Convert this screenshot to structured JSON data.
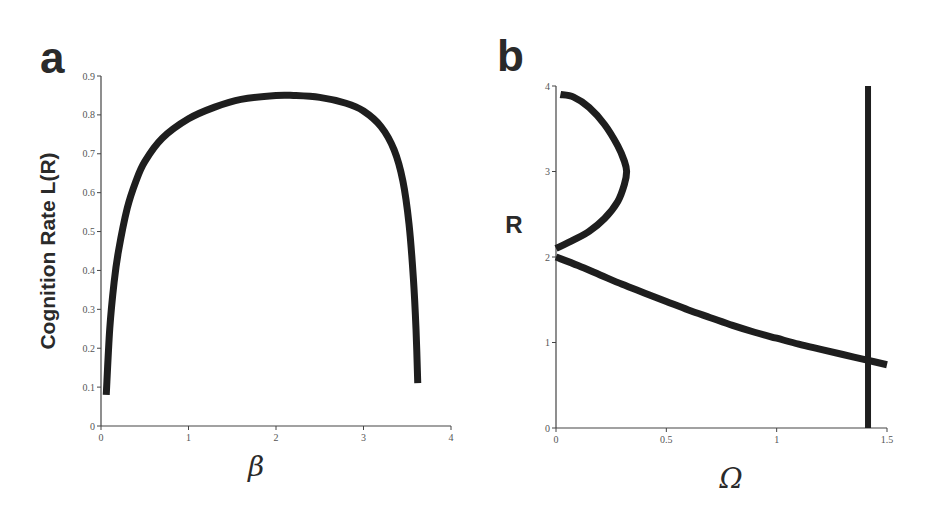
{
  "chart_data": [
    {
      "panel": "a",
      "type": "line",
      "title": "",
      "xlabel": "β",
      "ylabel": "Cognition Rate L(R)",
      "xlim": [
        0,
        4
      ],
      "ylim": [
        0,
        0.9
      ],
      "xticks": [
        "0",
        "1",
        "2",
        "3",
        "4"
      ],
      "yticks": [
        "0",
        "0.1",
        "0.2",
        "0.3",
        "0.4",
        "0.5",
        "0.6",
        "0.7",
        "0.8",
        "0.9"
      ],
      "grid": false,
      "series": [
        {
          "name": "L(R)",
          "x": [
            0.06,
            0.1,
            0.15,
            0.2,
            0.3,
            0.4,
            0.5,
            0.7,
            1.0,
            1.3,
            1.6,
            2.0,
            2.2,
            2.5,
            2.8,
            3.0,
            3.2,
            3.35,
            3.45,
            3.52,
            3.57,
            3.6,
            3.62
          ],
          "y": [
            0.08,
            0.25,
            0.37,
            0.45,
            0.56,
            0.63,
            0.68,
            0.74,
            0.79,
            0.82,
            0.84,
            0.85,
            0.85,
            0.845,
            0.83,
            0.81,
            0.77,
            0.71,
            0.63,
            0.52,
            0.38,
            0.25,
            0.11
          ]
        }
      ],
      "legend": null
    },
    {
      "panel": "b",
      "type": "line",
      "title": "",
      "xlabel": "Ω",
      "ylabel": "R",
      "xlim": [
        0,
        1.5
      ],
      "ylim": [
        0,
        4
      ],
      "xticks": [
        "0",
        "0.5",
        "1",
        "1.5"
      ],
      "yticks": [
        "0",
        "1",
        "2",
        "3",
        "4"
      ],
      "grid": false,
      "series": [
        {
          "name": "upper branch (arc)",
          "x": [
            0.02,
            0.08,
            0.15,
            0.22,
            0.28,
            0.31,
            0.32,
            0.31,
            0.28,
            0.22,
            0.15,
            0.08,
            0.0
          ],
          "y": [
            3.9,
            3.87,
            3.75,
            3.55,
            3.3,
            3.12,
            3.0,
            2.85,
            2.65,
            2.45,
            2.3,
            2.2,
            2.1
          ]
        },
        {
          "name": "lower branch",
          "x": [
            0.0,
            0.1,
            0.2,
            0.3,
            0.4,
            0.5,
            0.6,
            0.7,
            0.8,
            0.9,
            1.0,
            1.1,
            1.2,
            1.3,
            1.4,
            1.5
          ],
          "y": [
            2.0,
            1.9,
            1.79,
            1.68,
            1.58,
            1.48,
            1.38,
            1.29,
            1.2,
            1.12,
            1.05,
            0.98,
            0.92,
            0.86,
            0.8,
            0.74
          ]
        },
        {
          "name": "vertical line",
          "x": [
            1.414,
            1.414
          ],
          "y": [
            0,
            4
          ]
        }
      ],
      "legend": null
    }
  ],
  "panels": {
    "a": {
      "letter": "a",
      "ylabel": "Cognition Rate L(R)",
      "xlabel": "β"
    },
    "b": {
      "letter": "b",
      "ylabel": "R",
      "xlabel": "Ω"
    }
  },
  "colors": {
    "curve": "#1e1e1e",
    "axis": "#444444",
    "text": "#2a2a2a"
  }
}
